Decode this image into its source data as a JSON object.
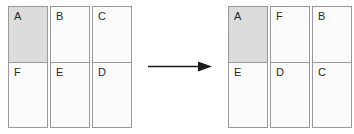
{
  "diagram": {
    "type": "transformation",
    "arrow": {
      "name": "right-arrow",
      "direction": "right",
      "color": "#1a1a1a"
    },
    "colors": {
      "cell_fill": "#fbfbfb",
      "cell_shaded_fill": "#dcdcdc",
      "border": "#9a9a9a",
      "label_text": "#2a2a2a"
    },
    "before": {
      "name": "before-grid",
      "rows": 2,
      "columns": 3,
      "cells": [
        {
          "label": "A",
          "row": 0,
          "column": 0,
          "shaded": true
        },
        {
          "label": "B",
          "row": 0,
          "column": 1,
          "shaded": false
        },
        {
          "label": "C",
          "row": 0,
          "column": 2,
          "shaded": false
        },
        {
          "label": "F",
          "row": 1,
          "column": 0,
          "shaded": false
        },
        {
          "label": "E",
          "row": 1,
          "column": 1,
          "shaded": false
        },
        {
          "label": "D",
          "row": 1,
          "column": 2,
          "shaded": false
        }
      ]
    },
    "after": {
      "name": "after-grid",
      "rows": 2,
      "columns": 3,
      "cells": [
        {
          "label": "A",
          "row": 0,
          "column": 0,
          "shaded": true
        },
        {
          "label": "F",
          "row": 0,
          "column": 1,
          "shaded": false
        },
        {
          "label": "B",
          "row": 0,
          "column": 2,
          "shaded": false
        },
        {
          "label": "E",
          "row": 1,
          "column": 0,
          "shaded": false
        },
        {
          "label": "D",
          "row": 1,
          "column": 1,
          "shaded": false
        },
        {
          "label": "C",
          "row": 1,
          "column": 2,
          "shaded": false
        }
      ]
    }
  }
}
